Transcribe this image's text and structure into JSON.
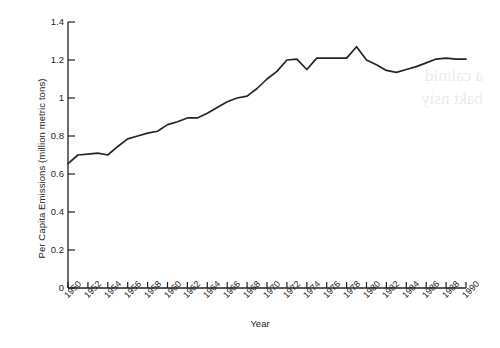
{
  "chart_data": {
    "type": "line",
    "title": "",
    "xlabel": "Year",
    "ylabel": "Per Capita Emissions (million metric tons)",
    "xlim": [
      1950,
      1990
    ],
    "ylim": [
      0,
      1.4
    ],
    "grid": false,
    "legend": false,
    "y_ticks": [
      0,
      0.2,
      0.4,
      0.6,
      0.8,
      1,
      1.2,
      1.4
    ],
    "y_tick_labels": [
      "0",
      "0.2",
      "0.4",
      "0.6",
      "0.8",
      "1",
      "1.2",
      "1.4"
    ],
    "x_ticks": [
      1950,
      1952,
      1954,
      1956,
      1958,
      1960,
      1962,
      1964,
      1966,
      1968,
      1970,
      1972,
      1974,
      1976,
      1978,
      1980,
      1982,
      1984,
      1986,
      1988,
      1990
    ],
    "x_tick_labels": [
      "1950",
      "1952",
      "1954",
      "1956",
      "1958",
      "1960",
      "1962",
      "1964",
      "1966",
      "1968",
      "1970",
      "1972",
      "1974",
      "1976",
      "1978",
      "1980",
      "1982",
      "1984",
      "1986",
      "1988",
      "1990"
    ],
    "line_color": "#262626",
    "x": [
      1950,
      1951,
      1952,
      1953,
      1954,
      1955,
      1956,
      1957,
      1958,
      1959,
      1960,
      1961,
      1962,
      1963,
      1964,
      1965,
      1966,
      1967,
      1968,
      1969,
      1970,
      1971,
      1972,
      1973,
      1974,
      1975,
      1976,
      1977,
      1978,
      1979,
      1980,
      1981,
      1982,
      1983,
      1984,
      1985,
      1986,
      1987,
      1988,
      1989,
      1990
    ],
    "values": [
      0.655,
      0.7,
      0.705,
      0.71,
      0.7,
      0.745,
      0.785,
      0.8,
      0.815,
      0.825,
      0.86,
      0.875,
      0.895,
      0.895,
      0.92,
      0.95,
      0.98,
      1.0,
      1.01,
      1.05,
      1.1,
      1.14,
      1.2,
      1.205,
      1.15,
      1.21,
      1.21,
      1.21,
      1.21,
      1.27,
      1.2,
      1.175,
      1.145,
      1.135,
      1.15,
      1.165,
      1.185,
      1.205,
      1.21,
      1.205,
      1.205
    ],
    "series": [
      {
        "name": "Per capita emissions",
        "values": [
          0.655,
          0.7,
          0.705,
          0.71,
          0.7,
          0.745,
          0.785,
          0.8,
          0.815,
          0.825,
          0.86,
          0.875,
          0.895,
          0.895,
          0.92,
          0.95,
          0.98,
          1.0,
          1.01,
          1.05,
          1.1,
          1.14,
          1.2,
          1.205,
          1.15,
          1.21,
          1.21,
          1.21,
          1.21,
          1.27,
          1.2,
          1.175,
          1.145,
          1.135,
          1.15,
          1.165,
          1.185,
          1.205,
          1.21,
          1.205,
          1.205
        ]
      }
    ]
  },
  "artifact": {
    "bleed_line_1": "a calmid",
    "bleed_line_2": "bakt nsiy"
  }
}
